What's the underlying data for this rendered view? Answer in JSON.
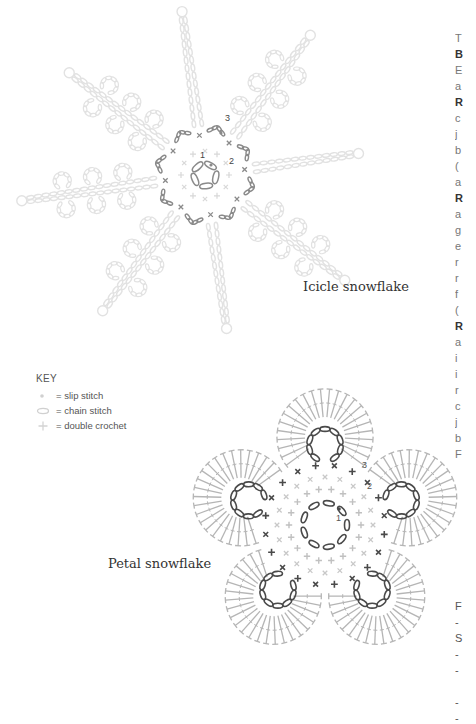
{
  "diagrams": [
    {
      "id": "icicle",
      "caption": "Icicle snowflake",
      "round_labels": [
        "1",
        "2",
        "3"
      ],
      "center": [
        205,
        175
      ],
      "arms": 8,
      "colors": {
        "inner": "#8a8a8a",
        "outer": "#e2e2e2"
      }
    },
    {
      "id": "petal",
      "caption": "Petal snowflake",
      "round_labels": [
        "1",
        "2",
        "3"
      ],
      "center": [
        325,
        525
      ],
      "petals": 5,
      "colors": {
        "dark": "#4a4a4a",
        "mid": "#b5b5b5",
        "light": "#c8c8c8"
      }
    }
  ],
  "key": {
    "title": "KEY",
    "items": [
      {
        "symbol": "dot",
        "label": "= slip stitch"
      },
      {
        "symbol": "oval",
        "label": "= chain stitch"
      },
      {
        "symbol": "plus",
        "label": "= double crochet"
      }
    ]
  },
  "right_column_fragments": {
    "top": [
      {
        "t": "T",
        "b": false
      },
      {
        "t": "B",
        "b": true
      },
      {
        "t": "E",
        "b": false
      },
      {
        "t": "a",
        "b": false
      },
      {
        "t": "R",
        "b": true
      },
      {
        "t": "c",
        "b": false
      },
      {
        "t": "j",
        "b": false
      },
      {
        "t": "b",
        "b": false
      },
      {
        "t": "(",
        "b": false
      },
      {
        "t": "a",
        "b": false
      },
      {
        "t": "R",
        "b": true
      },
      {
        "t": "a",
        "b": false
      },
      {
        "t": "g",
        "b": false
      },
      {
        "t": "e",
        "b": false
      },
      {
        "t": "r",
        "b": false
      },
      {
        "t": "r",
        "b": false
      },
      {
        "t": "f",
        "b": false
      },
      {
        "t": "(",
        "b": false
      },
      {
        "t": "R",
        "b": true
      },
      {
        "t": "a",
        "b": false
      },
      {
        "t": "i",
        "b": false
      },
      {
        "t": "i",
        "b": false
      },
      {
        "t": "r",
        "b": false
      },
      {
        "t": "c",
        "b": false
      },
      {
        "t": "j",
        "b": false
      },
      {
        "t": "b",
        "b": false
      },
      {
        "t": "F",
        "b": false
      }
    ],
    "bottom": [
      "F",
      "-",
      "S",
      "-",
      "-",
      "",
      "-",
      "-"
    ]
  }
}
